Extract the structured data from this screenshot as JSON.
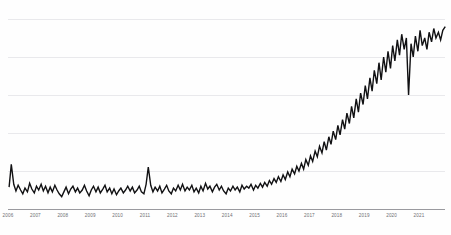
{
  "chart_data": {
    "type": "line",
    "title": "",
    "subtitle": "",
    "xlabel": "",
    "ylabel": "",
    "grid": true,
    "legend": false,
    "legend_position": "none",
    "series_color": "#111113",
    "grid_color": "#e9e9ec",
    "axis_color": "#9a9a9f",
    "background_color": "#fefefe",
    "tick_labels": [
      "2006",
      "2007",
      "2008",
      "2009",
      "2010",
      "2011",
      "2012",
      "2013",
      "2014",
      "2015",
      "2016",
      "2017",
      "2018",
      "2019",
      "2020",
      "2021"
    ],
    "x_start": 2006.0,
    "x_end": 2021.95,
    "ylim": [
      0,
      100
    ],
    "gridline_values": [
      100,
      80,
      60,
      40,
      20
    ],
    "y_axis_tick_labels_visible": false,
    "annotations": [],
    "x": [
      2006.04,
      2006.12,
      2006.21,
      2006.29,
      2006.37,
      2006.46,
      2006.54,
      2006.62,
      2006.71,
      2006.79,
      2006.87,
      2006.96,
      2007.04,
      2007.12,
      2007.21,
      2007.29,
      2007.37,
      2007.46,
      2007.54,
      2007.62,
      2007.71,
      2007.79,
      2007.87,
      2007.96,
      2008.04,
      2008.12,
      2008.21,
      2008.29,
      2008.37,
      2008.46,
      2008.54,
      2008.62,
      2008.71,
      2008.79,
      2008.87,
      2008.96,
      2009.04,
      2009.12,
      2009.21,
      2009.29,
      2009.37,
      2009.46,
      2009.54,
      2009.62,
      2009.71,
      2009.79,
      2009.87,
      2009.96,
      2010.04,
      2010.12,
      2010.21,
      2010.29,
      2010.37,
      2010.46,
      2010.54,
      2010.62,
      2010.71,
      2010.79,
      2010.87,
      2010.96,
      2011.04,
      2011.12,
      2011.21,
      2011.29,
      2011.37,
      2011.46,
      2011.54,
      2011.62,
      2011.71,
      2011.79,
      2011.87,
      2011.96,
      2012.04,
      2012.12,
      2012.21,
      2012.29,
      2012.37,
      2012.46,
      2012.54,
      2012.62,
      2012.71,
      2012.79,
      2012.87,
      2012.96,
      2013.04,
      2013.12,
      2013.21,
      2013.29,
      2013.37,
      2013.46,
      2013.54,
      2013.62,
      2013.71,
      2013.79,
      2013.87,
      2013.96,
      2014.04,
      2014.12,
      2014.21,
      2014.29,
      2014.37,
      2014.46,
      2014.54,
      2014.62,
      2014.71,
      2014.79,
      2014.87,
      2014.96,
      2015.04,
      2015.12,
      2015.21,
      2015.29,
      2015.37,
      2015.46,
      2015.54,
      2015.62,
      2015.71,
      2015.79,
      2015.87,
      2015.96,
      2016.04,
      2016.12,
      2016.21,
      2016.29,
      2016.37,
      2016.46,
      2016.54,
      2016.62,
      2016.71,
      2016.79,
      2016.87,
      2016.96,
      2017.04,
      2017.12,
      2017.21,
      2017.29,
      2017.37,
      2017.46,
      2017.54,
      2017.62,
      2017.71,
      2017.79,
      2017.87,
      2017.96,
      2018.04,
      2018.12,
      2018.21,
      2018.29,
      2018.37,
      2018.46,
      2018.54,
      2018.62,
      2018.71,
      2018.79,
      2018.87,
      2018.96,
      2019.04,
      2019.12,
      2019.21,
      2019.29,
      2019.37,
      2019.46,
      2019.54,
      2019.62,
      2019.71,
      2019.79,
      2019.87,
      2019.96,
      2020.04,
      2020.12,
      2020.21,
      2020.29,
      2020.37,
      2020.46,
      2020.54,
      2020.62,
      2020.71,
      2020.79,
      2020.87,
      2020.96,
      2021.04,
      2021.12,
      2021.21,
      2021.29,
      2021.37,
      2021.46,
      2021.54,
      2021.62,
      2021.71,
      2021.79,
      2021.87,
      2021.96
    ],
    "values": [
      11.5,
      23.5,
      13.0,
      9.5,
      12.5,
      10.0,
      8.0,
      11.0,
      9.0,
      13.5,
      10.5,
      8.5,
      12.0,
      10.0,
      13.0,
      9.5,
      12.0,
      8.5,
      11.5,
      9.0,
      12.5,
      10.0,
      8.0,
      6.5,
      9.0,
      11.5,
      8.0,
      10.5,
      12.0,
      9.0,
      11.0,
      8.5,
      10.0,
      12.5,
      9.5,
      7.0,
      10.0,
      12.0,
      9.0,
      11.5,
      8.5,
      10.5,
      12.5,
      9.0,
      11.0,
      8.0,
      10.5,
      7.5,
      9.5,
      11.0,
      8.5,
      10.0,
      12.0,
      9.5,
      11.5,
      8.5,
      10.0,
      12.0,
      9.0,
      8.0,
      13.0,
      22.0,
      12.5,
      9.0,
      11.5,
      9.5,
      12.0,
      8.5,
      10.5,
      12.5,
      9.5,
      8.0,
      11.0,
      9.5,
      12.5,
      10.0,
      13.0,
      9.5,
      11.5,
      10.0,
      12.5,
      9.0,
      11.0,
      8.5,
      12.0,
      9.5,
      13.5,
      10.5,
      12.0,
      9.0,
      11.5,
      13.0,
      10.0,
      12.0,
      9.5,
      8.0,
      11.0,
      9.5,
      12.0,
      10.0,
      11.5,
      9.0,
      12.5,
      10.5,
      12.0,
      11.0,
      13.0,
      10.0,
      12.5,
      11.0,
      13.5,
      11.5,
      14.0,
      12.0,
      15.0,
      13.0,
      16.0,
      14.0,
      17.0,
      14.5,
      18.0,
      15.5,
      19.5,
      17.0,
      21.0,
      18.5,
      22.5,
      20.0,
      24.0,
      21.0,
      26.0,
      23.0,
      28.0,
      25.0,
      30.5,
      27.5,
      33.0,
      29.5,
      35.5,
      31.0,
      38.0,
      34.0,
      41.0,
      36.5,
      44.0,
      39.0,
      47.0,
      42.0,
      50.5,
      45.0,
      54.0,
      48.0,
      58.0,
      51.0,
      61.0,
      55.0,
      65.0,
      58.0,
      69.0,
      62.0,
      73.0,
      66.0,
      77.0,
      68.0,
      80.0,
      72.0,
      83.0,
      74.0,
      86.0,
      78.0,
      89.0,
      81.0,
      92.0,
      84.0,
      90.0,
      60.0,
      87.0,
      80.0,
      91.0,
      83.0,
      94.0,
      86.0,
      90.0,
      84.0,
      93.0,
      88.0,
      95.0,
      90.0,
      93.0,
      89.0,
      94.0,
      96.0
    ]
  }
}
